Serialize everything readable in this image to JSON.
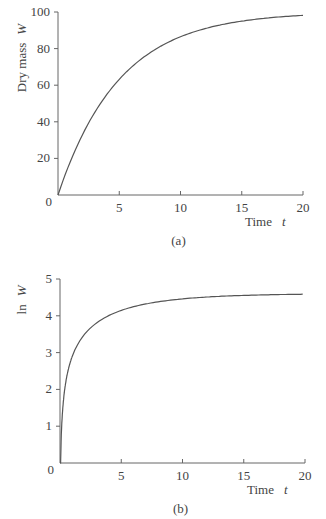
{
  "chart_data": [
    {
      "type": "line",
      "panel_label": "(a)",
      "title": "",
      "xlabel": "Time",
      "xlabel_var": "t",
      "ylabel": "Dry mass",
      "ylabel_var": "W",
      "xlim": [
        0,
        20
      ],
      "ylim": [
        0,
        100
      ],
      "xticks": [
        5,
        10,
        15,
        20
      ],
      "yticks": [
        20,
        40,
        60,
        80,
        100
      ],
      "origin_label": "0",
      "grid": false,
      "series": [
        {
          "name": "W",
          "x": [
            0,
            1,
            2,
            3,
            4,
            5,
            6,
            8,
            10,
            12,
            15,
            20
          ],
          "values": [
            0,
            18,
            33,
            45,
            55,
            63,
            70,
            80,
            86,
            91,
            95,
            98
          ]
        }
      ]
    },
    {
      "type": "line",
      "panel_label": "(b)",
      "title": "",
      "xlabel": "Time",
      "xlabel_var": "t",
      "ylabel": "ln",
      "ylabel_var": "W",
      "xlim": [
        0,
        20
      ],
      "ylim": [
        0,
        5
      ],
      "xticks": [
        5,
        10,
        15,
        20
      ],
      "yticks": [
        1,
        2,
        3,
        4,
        5
      ],
      "origin_label": "0",
      "grid": false,
      "series": [
        {
          "name": "ln W",
          "x": [
            0.05,
            0.2,
            0.5,
            1,
            2,
            3,
            5,
            8,
            10,
            15,
            20
          ],
          "values": [
            0,
            1.3,
            2.2,
            2.9,
            3.5,
            3.8,
            4.15,
            4.4,
            4.46,
            4.55,
            4.59
          ]
        }
      ]
    }
  ]
}
